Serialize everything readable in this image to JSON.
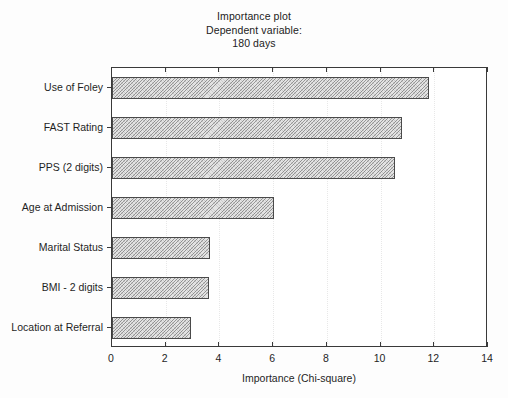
{
  "chart_data": {
    "type": "bar",
    "orientation": "horizontal",
    "title": "Importance plot\nDependent variable:\n180 days",
    "title_lines": [
      "Importance plot",
      "Dependent variable:",
      "180 days"
    ],
    "categories": [
      "Use of Foley",
      "FAST Rating",
      "PPS (2 digits)",
      "Age at Admission",
      "Marital Status",
      "BMI - 2 digits",
      "Location at Referral"
    ],
    "values": [
      11.8,
      10.8,
      10.55,
      6.05,
      3.65,
      3.6,
      2.95
    ],
    "xlabel": "Importance (Chi-square)",
    "ylabel": "",
    "xlim": [
      0,
      14
    ],
    "xticks": [
      0,
      2,
      4,
      6,
      8,
      10,
      12,
      14
    ],
    "xtick_labels": [
      "0",
      "2",
      "4",
      "6",
      "8",
      "10",
      "12",
      "14"
    ],
    "grid": true,
    "grid_axis": "x",
    "legend": null,
    "bar_fill": "#e3e3e3",
    "bar_edge": "#4a4a4a",
    "bar_pattern": "diagonal-hatch",
    "background": "#fdfdfd",
    "axis_color": "#3a3a3a"
  }
}
